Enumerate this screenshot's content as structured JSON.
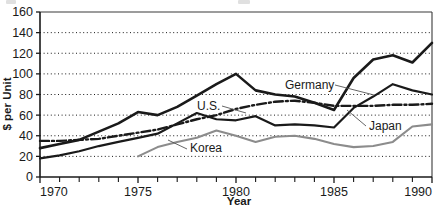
{
  "chart_data": {
    "type": "line",
    "title": "",
    "xlabel": "Year",
    "ylabel": "$ per Unit",
    "xlim": [
      1970,
      1990
    ],
    "ylim": [
      0,
      160
    ],
    "x_tick_labels": [
      "1970",
      "1975",
      "1980",
      "1985",
      "1990"
    ],
    "x_tick_values": [
      1970,
      1975,
      1980,
      1985,
      1990
    ],
    "x_minor_tick_values": [
      1971,
      1972,
      1973,
      1974,
      1976,
      1977,
      1978,
      1979,
      1981,
      1982,
      1983,
      1984,
      1986,
      1987,
      1988,
      1989
    ],
    "y_tick_labels": [
      "0",
      "20",
      "40",
      "60",
      "80",
      "100",
      "120",
      "140",
      "160"
    ],
    "y_tick_values": [
      0,
      20,
      40,
      60,
      80,
      100,
      120,
      140,
      160
    ],
    "grid": "horizontal-dotted",
    "legend": "inline-annotations",
    "x": [
      1970,
      1971,
      1972,
      1973,
      1974,
      1975,
      1976,
      1977,
      1978,
      1979,
      1980,
      1981,
      1982,
      1983,
      1984,
      1985,
      1986,
      1987,
      1988,
      1989,
      1990
    ],
    "series": [
      {
        "name": "Germany",
        "style": "solid-thick-black",
        "color": "#1a1a1a",
        "values": [
          28,
          32,
          36,
          44,
          52,
          63,
          60,
          68,
          79,
          90,
          100,
          84,
          80,
          78,
          72,
          65,
          96,
          114,
          118,
          111,
          130
        ]
      },
      {
        "name": "Japan",
        "style": "solid-medium-black",
        "color": "#1a1a1a",
        "values": [
          18,
          21,
          25,
          30,
          34,
          38,
          42,
          52,
          62,
          56,
          55,
          59,
          50,
          51,
          50,
          48,
          67,
          78,
          90,
          84,
          80
        ]
      },
      {
        "name": "U.S.",
        "style": "dash-dot-black",
        "color": "#1a1a1a",
        "values": [
          35,
          35,
          36,
          37,
          40,
          43,
          46,
          51,
          56,
          60,
          66,
          70,
          73,
          74,
          72,
          69,
          69,
          69,
          70,
          70,
          71
        ]
      },
      {
        "name": "Korea",
        "style": "solid-gray",
        "color": "#8c8c8c",
        "start_year": 1975,
        "values": [
          null,
          null,
          null,
          null,
          null,
          20,
          29,
          34,
          38,
          45,
          40,
          34,
          39,
          40,
          37,
          32,
          29,
          30,
          34,
          49,
          51
        ]
      }
    ],
    "annotations": [
      {
        "text": "Germany",
        "series": "Germany",
        "leader": true
      },
      {
        "text": "Japan",
        "series": "Japan",
        "leader": true
      },
      {
        "text": "U.S.",
        "series": "U.S.",
        "leader": true
      },
      {
        "text": "Korea",
        "series": "Korea",
        "leader": true
      }
    ]
  },
  "axes": {
    "ylabel": "$ per Unit",
    "xlabel": "Year",
    "y_ticks": [
      "160",
      "140",
      "120",
      "100",
      "80",
      "60",
      "40",
      "20",
      "0"
    ],
    "x_ticks": [
      "1970",
      "1975",
      "1980",
      "1985",
      "1990"
    ]
  },
  "labels": {
    "germany": "Germany",
    "japan": "Japan",
    "us": "U.S.",
    "korea": "Korea"
  }
}
